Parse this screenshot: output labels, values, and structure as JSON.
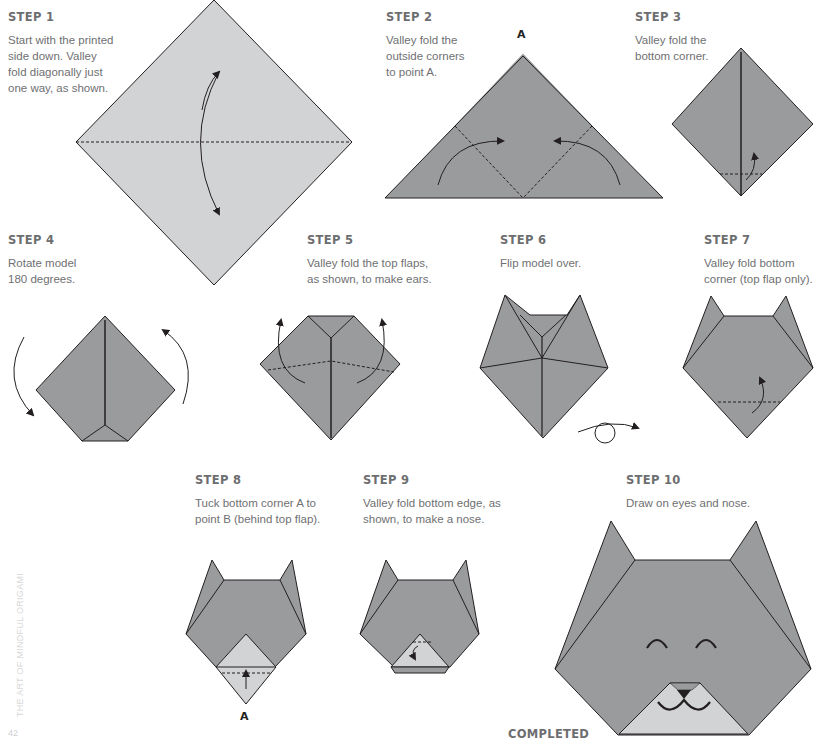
{
  "page": {
    "side_title": "THE ART OF MINDFUL ORIGAMI",
    "page_number": "42",
    "completed_label": "COMPLETED",
    "colors": {
      "paper_dark": "#9a9b9d",
      "paper_light": "#d2d3d4",
      "line": "#231f20",
      "heading": "#6d6e70",
      "text": "#6f7072"
    }
  },
  "steps": [
    {
      "title": "STEP 1",
      "text": [
        "Start with the printed",
        "side down. Valley",
        "fold diagonally just",
        "one way, as shown."
      ]
    },
    {
      "title": "STEP 2",
      "text": [
        "Valley fold the",
        "outside corners",
        "to point A."
      ],
      "point_label": "A"
    },
    {
      "title": "STEP 3",
      "text": [
        "Valley fold the",
        "bottom corner."
      ]
    },
    {
      "title": "STEP 4",
      "text": [
        "Rotate model",
        "180 degrees."
      ]
    },
    {
      "title": "STEP 5",
      "text": [
        "Valley fold the top flaps,",
        "as shown, to make ears."
      ]
    },
    {
      "title": "STEP 6",
      "text": [
        "Flip model over."
      ]
    },
    {
      "title": "STEP 7",
      "text": [
        "Valley fold bottom",
        "corner (top flap only)."
      ]
    },
    {
      "title": "STEP 8",
      "text": [
        "Tuck bottom corner A to",
        "point B (behind top flap)."
      ],
      "point_label": "A"
    },
    {
      "title": "STEP 9",
      "text": [
        "Valley fold bottom edge, as",
        "shown, to make a nose."
      ]
    },
    {
      "title": "STEP 10",
      "text": [
        "Draw on eyes and nose."
      ]
    }
  ]
}
